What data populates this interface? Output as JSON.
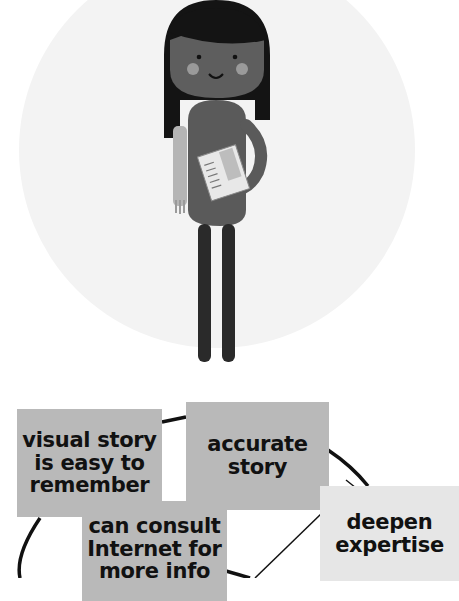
{
  "illustration": {
    "subject": "cartoon student girl holding notebook",
    "colors": {
      "background_circle": "#f2f2f2",
      "hair": "#141414",
      "skin": "#5e5e5e",
      "dress": "#5a5a5a",
      "legs": "#2a2a2a",
      "cheeks": "#9a9a9a",
      "scarf": "#b5b5b5",
      "notebook": "#e8e8e8"
    }
  },
  "diagram": {
    "boxes": [
      {
        "id": "visual-story",
        "label": "visual story\nis easy to\nremember"
      },
      {
        "id": "accurate-story",
        "label": "accurate\nstory"
      },
      {
        "id": "consult-internet",
        "label": "can consult\nInternet for\nmore info"
      },
      {
        "id": "deepen-expertise",
        "label": "deepen\nexpertise"
      }
    ],
    "colors": {
      "box_dark": "#b9b9b9",
      "box_light": "#e6e6e6",
      "line": "#111111"
    }
  }
}
